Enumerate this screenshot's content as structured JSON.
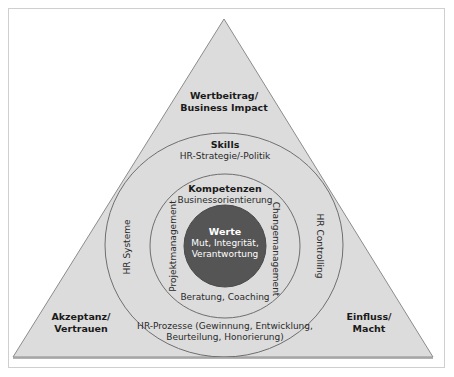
{
  "colors": {
    "triangle_fill": "#dcdcdc",
    "triangle_stroke": "#8c8c8c",
    "circle_stroke": "#6e6e6e",
    "core_fill": "#555555",
    "core_text": "#ffffff"
  },
  "triangle": {
    "top_label_line1": "Wertbeitrag/",
    "top_label_line2": "Business Impact",
    "left_label_line1": "Akzeptanz/",
    "left_label_line2": "Vertrauen",
    "right_label_line1": "Einfluss/",
    "right_label_line2": "Macht"
  },
  "outer_ring": {
    "title": "Skills",
    "top": "HR-Strategie/-Politik",
    "left": "HR Systeme",
    "right": "HR Controlling",
    "bottom_line1": "HR-Prozesse (Gewinnung, Entwicklung,",
    "bottom_line2": "Beurteilung, Honorierung)"
  },
  "middle_ring": {
    "title": "Kompetenzen",
    "top": "Businessorientierung",
    "left": "Projektmanagement",
    "right": "Changemanagement",
    "bottom": "Beratung, Coaching"
  },
  "core": {
    "title": "Werte",
    "line1": "Mut, Integrität,",
    "line2": "Verantwortung"
  }
}
